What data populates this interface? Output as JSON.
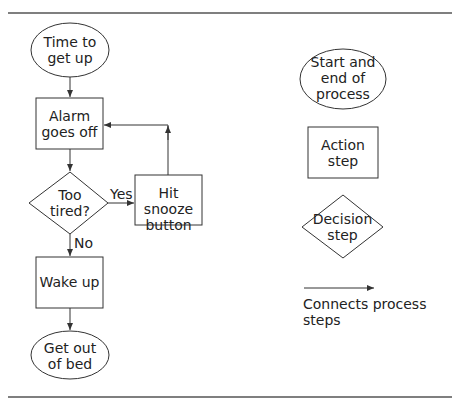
{
  "flowchart": {
    "nodes": {
      "start": "Time to\nget up",
      "alarm": "Alarm\ngoes off",
      "decision": "Too\ntired?",
      "snooze": "Hit snooze\nbutton",
      "wake": "Wake up",
      "end": "Get out\nof bed"
    },
    "edges": {
      "yes_label": "Yes",
      "no_label": "No"
    }
  },
  "legend": {
    "terminal": "Start and\nend of\nprocess",
    "action": "Action\nstep",
    "decision": "Decision\nstep",
    "connector": "Connects process steps"
  },
  "colors": {
    "stroke": "#333333",
    "rule": "#555555",
    "background": "#ffffff"
  }
}
